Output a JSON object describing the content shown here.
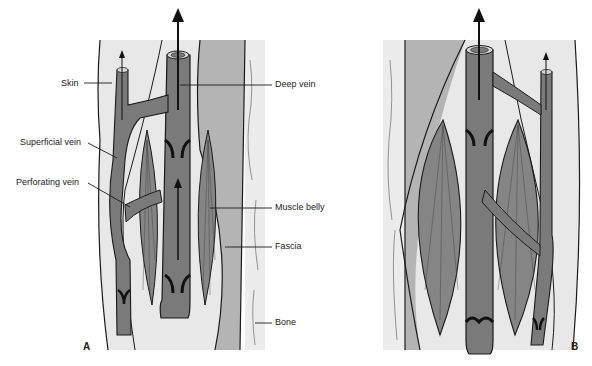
{
  "figure": {
    "colors": {
      "vein": "#7a7a7a",
      "muscle": "#858585",
      "skin_tissue": "#e8e8e8",
      "fascia_band": "#b4b4b4",
      "bone": "#ececec",
      "outline": "#1a1a1a",
      "background": "#ffffff"
    },
    "panels": [
      {
        "id": "A",
        "letter": "A",
        "labels": {
          "skin": "Skin",
          "superficial_vein": "Superficial vein",
          "perforating_vein": "Perforating vein",
          "deep_vein": "Deep vein",
          "muscle_belly": "Muscle belly",
          "fascia": "Fascia",
          "bone": "Bone"
        },
        "state": "muscle relaxed"
      },
      {
        "id": "B",
        "letter": "B",
        "state": "muscle contracted"
      }
    ]
  }
}
